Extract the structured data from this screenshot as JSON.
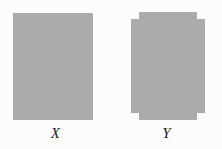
{
  "figure": {
    "background_color": "#fcfcfc",
    "shape_fill_color": "#ababab",
    "label_color": "#1c1c1c",
    "caption_style": "italic-serif"
  },
  "shapes": [
    {
      "id": "x",
      "label": "X",
      "kind": "rectangle",
      "description": "plain solid rectangle",
      "fill": "#ababab",
      "bounds": {
        "x": 13,
        "y": 13,
        "width": 80,
        "height": 107
      },
      "notches": [],
      "polygon_points": "13,13 93,13 93,120 13,120"
    },
    {
      "id": "y",
      "label": "Y",
      "kind": "notched-rectangle",
      "description": "rectangle with four rectangular corner notches removed",
      "fill": "#ababab",
      "bounds": {
        "x": 131,
        "y": 12,
        "width": 74,
        "height": 108
      },
      "notch_size": {
        "width": 8,
        "height": 7
      },
      "notches": [
        "top-left",
        "top-right",
        "bottom-left",
        "bottom-right"
      ],
      "polygon_points": "139,12 197,12 197,19 205,19 205,113 197,113 197,120 139,120 139,113 131,113 131,19 139,19"
    }
  ]
}
